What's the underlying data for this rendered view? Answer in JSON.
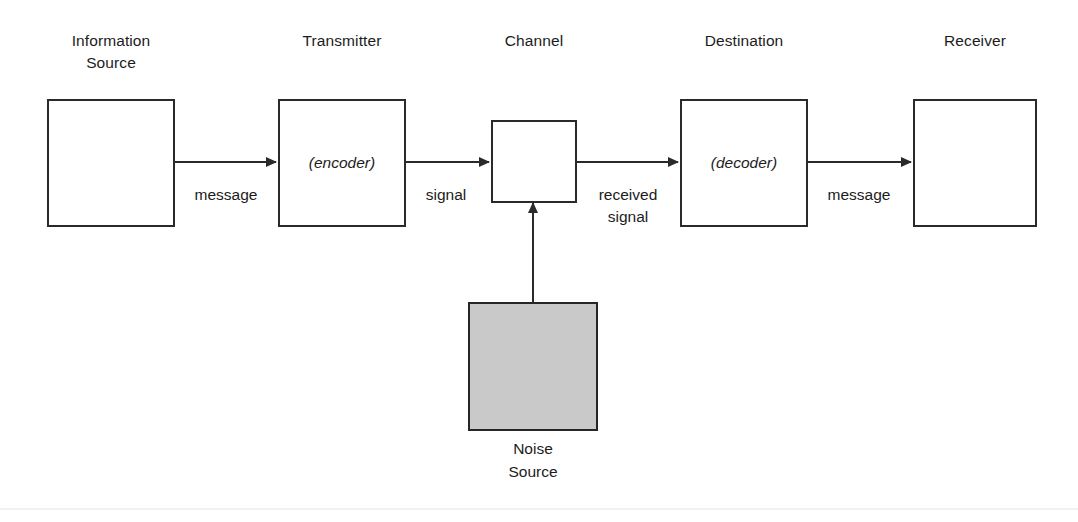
{
  "diagram": {
    "title_text": "",
    "background_color": "#ffffff",
    "line_color": "#2a2a2a",
    "text_color": "#1c1c1c",
    "noise_fill_color": "#c9c9c9",
    "blocks": [
      {
        "id": "information-source",
        "label": "Information\nSource",
        "inner_text": "",
        "filled": false
      },
      {
        "id": "transmitter",
        "label": "Transmitter",
        "inner_text": "(encoder)",
        "filled": false
      },
      {
        "id": "channel",
        "label": "Channel",
        "inner_text": "",
        "filled": false
      },
      {
        "id": "destination",
        "label": "Destination",
        "inner_text": "(decoder)",
        "filled": false
      },
      {
        "id": "receiver",
        "label": "Receiver",
        "inner_text": "",
        "filled": false
      },
      {
        "id": "noise-source",
        "label": "Noise\nSource",
        "inner_text": "",
        "filled": true
      }
    ],
    "edges": [
      {
        "id": "source-to-transmitter",
        "caption": "message",
        "direction": "right"
      },
      {
        "id": "transmitter-to-channel",
        "caption": "signal",
        "direction": "right"
      },
      {
        "id": "channel-to-destination",
        "caption": "received\nsignal",
        "direction": "right"
      },
      {
        "id": "destination-to-receiver",
        "caption": "message",
        "direction": "right"
      },
      {
        "id": "noise-to-channel",
        "caption": "",
        "direction": "up"
      }
    ]
  }
}
